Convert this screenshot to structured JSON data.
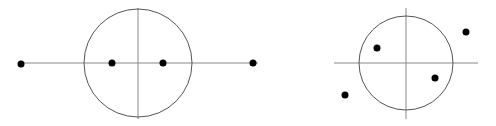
{
  "colors": {
    "background": "#ffffff",
    "axis": "#888888",
    "circle": "#555555",
    "point": "#000000"
  },
  "diagrams": [
    {
      "id": "left",
      "description": "Unit circle with four real points on the horizontal axis",
      "circle": {
        "cx": 138,
        "cy": 63,
        "r": 54
      },
      "h_axis": {
        "x1": 20,
        "x2": 258,
        "y": 63
      },
      "v_axis": {
        "x": 138,
        "y1": 8,
        "y2": 119
      },
      "points": [
        {
          "x": 21,
          "y": 64
        },
        {
          "x": 112,
          "y": 63
        },
        {
          "x": 163,
          "y": 63
        },
        {
          "x": 253,
          "y": 63
        }
      ]
    },
    {
      "id": "right",
      "description": "Unit circle with four points in the complex plane",
      "circle": {
        "cx": 406,
        "cy": 63,
        "r": 47
      },
      "h_axis": {
        "x1": 334,
        "x2": 478,
        "y": 63
      },
      "v_axis": {
        "x": 406,
        "y1": 8,
        "y2": 119
      },
      "points": [
        {
          "x": 377,
          "y": 48
        },
        {
          "x": 466,
          "y": 32
        },
        {
          "x": 435,
          "y": 78
        },
        {
          "x": 345,
          "y": 95
        }
      ]
    }
  ]
}
